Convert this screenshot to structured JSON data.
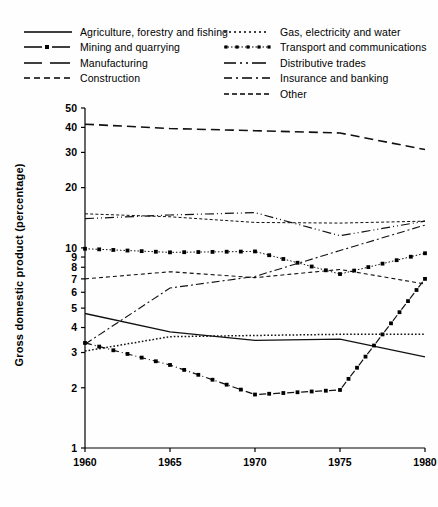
{
  "legend": {
    "left_column": [
      {
        "label": "Agriculture, forestry and fishing",
        "key": "solid"
      },
      {
        "label": "Mining and quarrying",
        "key": "dash-dot-marker"
      },
      {
        "label": "Manufacturing",
        "key": "long-dash"
      },
      {
        "label": "Construction",
        "key": "dashed-small"
      }
    ],
    "right_column": [
      {
        "label": "Gas, electricity and water",
        "key": "dotted"
      },
      {
        "label": "Transport and communications",
        "key": "dotted-marker"
      },
      {
        "label": "Distributive trades",
        "key": "dash-dot-dot"
      },
      {
        "label": "Insurance and banking",
        "key": "dash-dot"
      },
      {
        "label": "Other",
        "key": "dashed-fine"
      }
    ]
  },
  "axes": {
    "y_label": "Gross domestic product (percentage)",
    "y_ticks": [
      "50",
      "40",
      "30",
      "20",
      "10",
      "9",
      "8",
      "7",
      "6",
      "5",
      "4",
      "3",
      "2",
      "1"
    ],
    "x_ticks": [
      "1960",
      "1965",
      "1970",
      "1975",
      "1980"
    ]
  },
  "chart_data": {
    "type": "line",
    "title": "",
    "xlabel": "",
    "ylabel": "Gross domestic product (percentage)",
    "yscale": "log",
    "ylim": [
      1,
      50
    ],
    "xlim": [
      1960,
      1980
    ],
    "grid": false,
    "legend_position": "top",
    "x": [
      1960,
      1965,
      1970,
      1975,
      1980
    ],
    "series": [
      {
        "name": "Agriculture, forestry and fishing",
        "style": "solid",
        "values": [
          4.7,
          3.8,
          3.45,
          3.5,
          2.85
        ]
      },
      {
        "name": "Mining and quarrying",
        "style": "dash-dot-marker",
        "values": [
          3.35,
          2.6,
          1.85,
          1.95,
          7.0
        ]
      },
      {
        "name": "Manufacturing",
        "style": "long-dash",
        "values": [
          41.5,
          39.5,
          38.5,
          37.5,
          31.0
        ]
      },
      {
        "name": "Construction",
        "style": "dashed-small",
        "values": [
          7.0,
          7.6,
          7.1,
          7.8,
          6.6
        ]
      },
      {
        "name": "Gas, electricity and water",
        "style": "dotted",
        "values": [
          3.05,
          3.6,
          3.65,
          3.7,
          3.7
        ]
      },
      {
        "name": "Transport and communications",
        "style": "dotted-marker",
        "values": [
          9.9,
          9.5,
          9.6,
          7.4,
          9.4
        ]
      },
      {
        "name": "Distributive trades",
        "style": "dash-dot-dot",
        "values": [
          14.0,
          14.6,
          15.0,
          11.5,
          13.6
        ]
      },
      {
        "name": "Insurance and banking",
        "style": "dash-dot",
        "values": [
          3.3,
          6.3,
          7.2,
          9.7,
          13.0
        ]
      },
      {
        "name": "Other",
        "style": "dashed-fine",
        "values": [
          14.8,
          14.3,
          13.4,
          13.3,
          13.6
        ]
      }
    ]
  }
}
